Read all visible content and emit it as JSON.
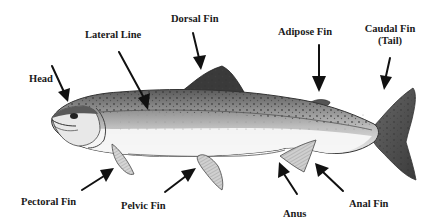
{
  "diagram": {
    "colors": {
      "text": "#1a1a1a",
      "arrow": "#111111",
      "fish_dark": "#2b2b2b",
      "fish_mid": "#8a8a8a",
      "fish_light": "#e6e6e6",
      "background": "#ffffff"
    },
    "labels": {
      "head": "Head",
      "lateral_line": "Lateral Line",
      "dorsal_fin": "Dorsal Fin",
      "adipose_fin": "Adipose Fin",
      "caudal_fin_line1": "Caudal Fin",
      "caudal_fin_line2": "(Tail)",
      "pectoral_fin": "Pectoral Fin",
      "pelvic_fin": "Pelvic Fin",
      "anus": "Anus",
      "anal_fin": "Anal Fin"
    }
  }
}
